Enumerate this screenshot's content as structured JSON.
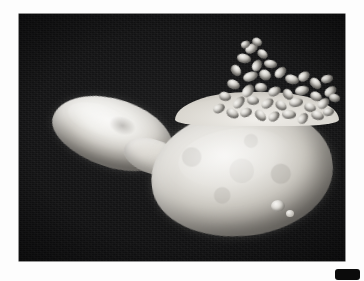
{
  "page": {
    "background_color": "#fdfdfd",
    "kind": "scanned-figure-page"
  },
  "figure": {
    "alt": "Scanning electron micrograph of a budding yeast cell with a cluster of small rod-shaped microbes attached to its upper surface",
    "frame_color": "#0d0d0d",
    "background_color": "#121213",
    "subject_color": "#e8e6e2",
    "caption": "",
    "label": "",
    "magnification_bar": "",
    "scale_text": ""
  },
  "badge": {
    "name": "corner-badge",
    "text": "",
    "background_color": "#0b0b0b",
    "text_color": "#4a4a4a"
  },
  "structures": {
    "mother_cell": "mother-cell",
    "daughter_bud": "daughter-bud",
    "isthmus": "bud-neck",
    "microbe_cluster": "attached-microbe-cluster",
    "surface_blebs": "surface-blebs"
  }
}
